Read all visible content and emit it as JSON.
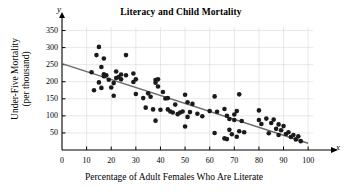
{
  "chart_data": {
    "type": "scatter",
    "title": "Literacy and Child Mortality",
    "xlabel": "Percentage of Adult Females Who Are Literate",
    "ylabel": "Under-Five Mortality (per thousand)",
    "ylabel_line1": "Under-Five Mortality",
    "ylabel_line2": "(per thousand)",
    "x_axis_letter": "x",
    "y_axis_letter": "y",
    "xlim": [
      0,
      104
    ],
    "ylim": [
      0,
      375
    ],
    "xticks": [
      0,
      10,
      20,
      30,
      40,
      50,
      60,
      70,
      80,
      90,
      100
    ],
    "yticks": [
      50,
      100,
      150,
      200,
      250,
      300,
      350
    ],
    "grid": true,
    "legend": "none",
    "point_color": "#1a1a1a",
    "line_color": "#6b6b6b",
    "grid_color": "#d8d8d8",
    "axis_color": "#000000",
    "trendline": {
      "label": "least-squares regression line",
      "x0": 0,
      "y0": 253,
      "x1": 100,
      "y1": 20
    },
    "points": [
      [
        12,
        228
      ],
      [
        13,
        175
      ],
      [
        14,
        278
      ],
      [
        15,
        302
      ],
      [
        15,
        198
      ],
      [
        16,
        182
      ],
      [
        16,
        243
      ],
      [
        17,
        268
      ],
      [
        17,
        222
      ],
      [
        17,
        216
      ],
      [
        18,
        219
      ],
      [
        19,
        206
      ],
      [
        20,
        183
      ],
      [
        21,
        159
      ],
      [
        21,
        196
      ],
      [
        22,
        230
      ],
      [
        22,
        211
      ],
      [
        23,
        214
      ],
      [
        24,
        221
      ],
      [
        24,
        207
      ],
      [
        26,
        278
      ],
      [
        26,
        219
      ],
      [
        29,
        224
      ],
      [
        29,
        199
      ],
      [
        30,
        207
      ],
      [
        30,
        164
      ],
      [
        33,
        152
      ],
      [
        34,
        124
      ],
      [
        35,
        166
      ],
      [
        36,
        156
      ],
      [
        37,
        119
      ],
      [
        38,
        86
      ],
      [
        38,
        205
      ],
      [
        38,
        197
      ],
      [
        39,
        207
      ],
      [
        39,
        186
      ],
      [
        40,
        118
      ],
      [
        41,
        170
      ],
      [
        42,
        151
      ],
      [
        43,
        152
      ],
      [
        43,
        119
      ],
      [
        44,
        113
      ],
      [
        45,
        110
      ],
      [
        46,
        133
      ],
      [
        47,
        105
      ],
      [
        48,
        110
      ],
      [
        49,
        113
      ],
      [
        50,
        162
      ],
      [
        50,
        69
      ],
      [
        51,
        97
      ],
      [
        51,
        140
      ],
      [
        52,
        111
      ],
      [
        53,
        135
      ],
      [
        55,
        106
      ],
      [
        57,
        99
      ],
      [
        60,
        114
      ],
      [
        62,
        157
      ],
      [
        62,
        50
      ],
      [
        63,
        112
      ],
      [
        66,
        120
      ],
      [
        66,
        34
      ],
      [
        67,
        100
      ],
      [
        67,
        32
      ],
      [
        68,
        91
      ],
      [
        68,
        59
      ],
      [
        69,
        46
      ],
      [
        70,
        88
      ],
      [
        70,
        104
      ],
      [
        71,
        39
      ],
      [
        71,
        114
      ],
      [
        72,
        163
      ],
      [
        72,
        55
      ],
      [
        73,
        85
      ],
      [
        74,
        52
      ],
      [
        80,
        116
      ],
      [
        80,
        88
      ],
      [
        81,
        76
      ],
      [
        83,
        92
      ],
      [
        84,
        49
      ],
      [
        85,
        79
      ],
      [
        86,
        89
      ],
      [
        87,
        62
      ],
      [
        88,
        44
      ],
      [
        88,
        75
      ],
      [
        89,
        58
      ],
      [
        90,
        70
      ],
      [
        91,
        47
      ],
      [
        92,
        52
      ],
      [
        93,
        38
      ],
      [
        94,
        44
      ],
      [
        95,
        31
      ],
      [
        96,
        40
      ],
      [
        97,
        26
      ]
    ]
  }
}
